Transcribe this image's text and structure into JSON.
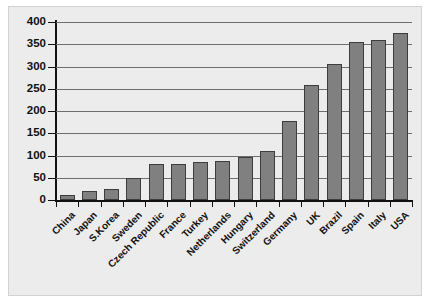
{
  "chart_data": {
    "type": "bar",
    "title": "",
    "subtitle": "",
    "xlabel": "",
    "ylabel": "",
    "ylim": [
      0,
      400
    ],
    "ytick_step": 50,
    "yticks": [
      0,
      50,
      100,
      150,
      200,
      250,
      300,
      350,
      400
    ],
    "ytick_labels": [
      "0",
      "50",
      "100",
      "150",
      "200",
      "250",
      "300",
      "350",
      "400"
    ],
    "grid": true,
    "grid_axis": "y",
    "legend": false,
    "legend_position": "none",
    "annotations": [],
    "categories": [
      "China",
      "Japan",
      "S.Korea",
      "Sweden",
      "Czech Republic",
      "France",
      "Turkey",
      "Netherlands",
      "Hungary",
      "Switzerland",
      "Germany",
      "UK",
      "Brazil",
      "Spain",
      "Italy",
      "USA"
    ],
    "values": [
      12,
      20,
      25,
      50,
      80,
      80,
      85,
      87,
      97,
      110,
      178,
      258,
      305,
      355,
      360,
      375
    ]
  },
  "style": {
    "bar_fill": "#808080",
    "bar_edge": "#3d3d3d",
    "panel_background": "#ececec",
    "panel_border": "#d2d2d2",
    "page_background": "#ffffff",
    "axis_color": "#111111",
    "gridline_color": "#6e6e6e",
    "label_color": "#111111"
  }
}
